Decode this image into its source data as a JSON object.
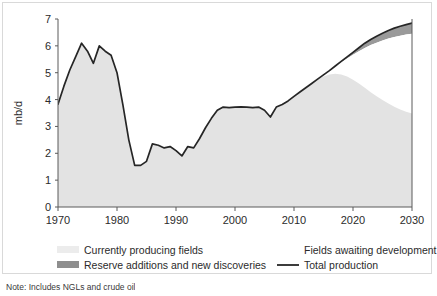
{
  "figure": {
    "note": "Note: Includes NGLs and crude oil"
  },
  "axes": {
    "y_title": "mb/d",
    "y_ticks": [
      0,
      1,
      2,
      3,
      4,
      5,
      6,
      7
    ],
    "x_ticks": [
      1970,
      1980,
      1990,
      2000,
      2010,
      2020,
      2030
    ],
    "xlim": [
      1970,
      2030
    ],
    "ylim": [
      0,
      7
    ]
  },
  "legend": {
    "items": [
      {
        "label": "Currently producing fields",
        "swatch": "#ececec",
        "type": "area"
      },
      {
        "label": "Fields awaiting development",
        "swatch": "#ffffff",
        "type": "area"
      },
      {
        "label": "Reserve additions and new discoveries",
        "swatch": "#8e8e8e",
        "type": "area"
      },
      {
        "label": "Total production",
        "swatch": "#262626",
        "type": "line"
      }
    ]
  },
  "colors": {
    "currently_producing": "#e3e3e3",
    "awaiting_development": "#ffffff",
    "reserve_additions": "#9a9a9a",
    "total_production_line": "#262626",
    "axis": "#5a5a5a",
    "frame": "#d9d9d9"
  },
  "chart_data": {
    "type": "area",
    "title": "",
    "xlabel": "",
    "ylabel": "mb/d",
    "xlim": [
      1970,
      2030
    ],
    "ylim": [
      0,
      7
    ],
    "grid": false,
    "legend_position": "bottom",
    "x": [
      1970,
      1971,
      1972,
      1973,
      1974,
      1975,
      1976,
      1977,
      1978,
      1979,
      1980,
      1981,
      1982,
      1983,
      1984,
      1985,
      1986,
      1987,
      1988,
      1989,
      1990,
      1991,
      1992,
      1993,
      1994,
      1995,
      1996,
      1997,
      1998,
      1999,
      2000,
      2001,
      2002,
      2003,
      2004,
      2005,
      2006,
      2007,
      2008,
      2009,
      2010,
      2011,
      2012,
      2013,
      2014,
      2015,
      2016,
      2017,
      2018,
      2019,
      2020,
      2021,
      2022,
      2023,
      2024,
      2025,
      2026,
      2027,
      2028,
      2029,
      2030
    ],
    "series": [
      {
        "name": "Total production",
        "type": "line",
        "values": [
          3.83,
          4.5,
          5.1,
          5.6,
          6.1,
          5.8,
          5.35,
          6.0,
          5.8,
          5.65,
          5.0,
          3.8,
          2.5,
          1.55,
          1.55,
          1.7,
          2.35,
          2.3,
          2.2,
          2.25,
          2.1,
          1.9,
          2.25,
          2.2,
          2.55,
          2.95,
          3.3,
          3.6,
          3.72,
          3.7,
          3.72,
          3.73,
          3.72,
          3.7,
          3.72,
          3.6,
          3.35,
          3.72,
          3.82,
          3.95,
          4.12,
          4.28,
          4.44,
          4.6,
          4.76,
          4.92,
          5.08,
          5.25,
          5.42,
          5.59,
          5.76,
          5.93,
          6.1,
          6.24,
          6.36,
          6.47,
          6.57,
          6.66,
          6.73,
          6.79,
          6.85
        ]
      },
      {
        "name": "Currently producing fields",
        "type": "area",
        "values": [
          3.83,
          4.5,
          5.1,
          5.6,
          6.1,
          5.8,
          5.35,
          6.0,
          5.8,
          5.65,
          5.0,
          3.8,
          2.5,
          1.55,
          1.55,
          1.7,
          2.35,
          2.3,
          2.2,
          2.25,
          2.1,
          1.9,
          2.25,
          2.2,
          2.55,
          2.95,
          3.3,
          3.6,
          3.72,
          3.7,
          3.72,
          3.73,
          3.72,
          3.7,
          3.72,
          3.6,
          3.35,
          3.72,
          3.82,
          3.95,
          4.12,
          4.28,
          4.44,
          4.6,
          4.76,
          4.86,
          4.93,
          4.96,
          4.93,
          4.86,
          4.74,
          4.6,
          4.44,
          4.27,
          4.12,
          3.98,
          3.85,
          3.73,
          3.63,
          3.55,
          3.48
        ]
      },
      {
        "name": "Fields awaiting development",
        "type": "area",
        "note": "band between currently producing fields and the lower edge of reserve additions",
        "values_top": [
          3.83,
          4.5,
          5.1,
          5.6,
          6.1,
          5.8,
          5.35,
          6.0,
          5.8,
          5.65,
          5.0,
          3.8,
          2.5,
          1.55,
          1.55,
          1.7,
          2.35,
          2.3,
          2.2,
          2.25,
          2.1,
          1.9,
          2.25,
          2.2,
          2.55,
          2.95,
          3.3,
          3.6,
          3.72,
          3.7,
          3.72,
          3.73,
          3.72,
          3.7,
          3.72,
          3.6,
          3.35,
          3.72,
          3.82,
          3.95,
          4.12,
          4.28,
          4.44,
          4.6,
          4.76,
          4.92,
          5.08,
          5.25,
          5.39,
          5.53,
          5.67,
          5.8,
          5.92,
          6.03,
          6.12,
          6.2,
          6.27,
          6.33,
          6.38,
          6.42,
          6.45
        ]
      },
      {
        "name": "Reserve additions and new discoveries",
        "type": "area",
        "note": "band between upper edge of fields awaiting development and total production",
        "values_bottom": [
          3.83,
          4.5,
          5.1,
          5.6,
          6.1,
          5.8,
          5.35,
          6.0,
          5.8,
          5.65,
          5.0,
          3.8,
          2.5,
          1.55,
          1.55,
          1.7,
          2.35,
          2.3,
          2.2,
          2.25,
          2.1,
          1.9,
          2.25,
          2.2,
          2.55,
          2.95,
          3.3,
          3.6,
          3.72,
          3.7,
          3.72,
          3.73,
          3.72,
          3.7,
          3.72,
          3.6,
          3.35,
          3.72,
          3.82,
          3.95,
          4.12,
          4.28,
          4.44,
          4.6,
          4.76,
          4.92,
          5.08,
          5.25,
          5.39,
          5.53,
          5.67,
          5.8,
          5.92,
          6.03,
          6.12,
          6.2,
          6.27,
          6.33,
          6.38,
          6.42,
          6.45
        ],
        "values_top": [
          3.83,
          4.5,
          5.1,
          5.6,
          6.1,
          5.8,
          5.35,
          6.0,
          5.8,
          5.65,
          5.0,
          3.8,
          2.5,
          1.55,
          1.55,
          1.7,
          2.35,
          2.3,
          2.2,
          2.25,
          2.1,
          1.9,
          2.25,
          2.2,
          2.55,
          2.95,
          3.3,
          3.6,
          3.72,
          3.7,
          3.72,
          3.73,
          3.72,
          3.7,
          3.72,
          3.6,
          3.35,
          3.72,
          3.82,
          3.95,
          4.12,
          4.28,
          4.44,
          4.6,
          4.76,
          4.92,
          5.08,
          5.25,
          5.42,
          5.59,
          5.76,
          5.93,
          6.1,
          6.24,
          6.36,
          6.47,
          6.57,
          6.66,
          6.73,
          6.79,
          6.85
        ]
      }
    ]
  }
}
